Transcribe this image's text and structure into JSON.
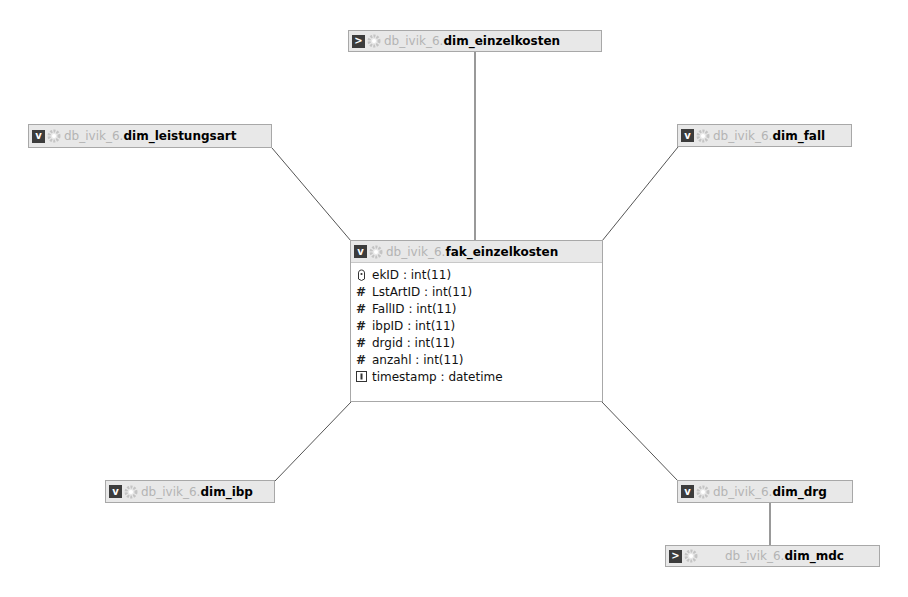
{
  "diagram": {
    "schema": "db_ivik_6",
    "separator": ".",
    "fact_table": {
      "name": "fak_einzelkosten",
      "toggle": "v",
      "fields": [
        {
          "icon": "key-icon",
          "label": "ekID : int(11)"
        },
        {
          "icon": "hash-icon",
          "label": "LstArtID : int(11)"
        },
        {
          "icon": "hash-icon",
          "label": "FallID : int(11)"
        },
        {
          "icon": "hash-icon",
          "label": "ibpID : int(11)"
        },
        {
          "icon": "hash-icon",
          "label": "drgid : int(11)"
        },
        {
          "icon": "hash-icon",
          "label": "anzahl : int(11)"
        },
        {
          "icon": "timestamp-icon",
          "label": "timestamp : datetime"
        }
      ]
    },
    "dimension_tables": [
      {
        "id": "dim_einzelkosten",
        "name": "dim_einzelkosten",
        "toggle": ">"
      },
      {
        "id": "dim_leistungsart",
        "name": "dim_leistungsart",
        "toggle": "v"
      },
      {
        "id": "dim_fall",
        "name": "dim_fall",
        "toggle": "v"
      },
      {
        "id": "dim_ibp",
        "name": "dim_ibp",
        "toggle": "v"
      },
      {
        "id": "dim_drg",
        "name": "dim_drg",
        "toggle": "v"
      },
      {
        "id": "dim_mdc",
        "name": "dim_mdc",
        "toggle": ">"
      }
    ],
    "hash_glyph": "#",
    "colors": {
      "line": "#555555",
      "header_bg": "#e8e8e8",
      "schema_text": "#b4b4b4",
      "toggle_bg": "#3c3c3c"
    }
  }
}
